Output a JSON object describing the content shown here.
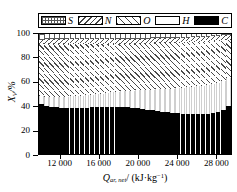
{
  "chart_data": {
    "type": "bar",
    "stacked": true,
    "title": "",
    "xlabel": "Q_ar,net / (kJ·kg⁻¹)",
    "ylabel": "X_V/%",
    "ylim": [
      0,
      100
    ],
    "xlim": [
      9800,
      29600
    ],
    "grid": false,
    "legend_position": "top",
    "legend": [
      {
        "label": "S",
        "pattern": "cross-hatch",
        "color": "#ffffff"
      },
      {
        "label": "N",
        "pattern": "diagonal-back-hatch",
        "color": "#ffffff"
      },
      {
        "label": "O",
        "pattern": "diagonal-forward-hatch",
        "color": "#ffffff"
      },
      {
        "label": "H",
        "pattern": "solid-white",
        "color": "#ffffff"
      },
      {
        "label": "C",
        "pattern": "solid-black",
        "color": "#000000"
      }
    ],
    "ytick_labels": [
      "100",
      "80",
      "60",
      "40",
      "20",
      "0"
    ],
    "ytick_values": [
      100,
      80,
      60,
      40,
      20,
      0
    ],
    "xtick_labels": [
      "12 000",
      "16 000",
      "20 000",
      "24 000",
      "28 000"
    ],
    "xtick_values": [
      12000,
      16000,
      20000,
      24000,
      28000
    ],
    "x": [
      10100,
      10620,
      11140,
      11660,
      12180,
      12700,
      13220,
      13740,
      14260,
      14780,
      15300,
      15820,
      16340,
      16860,
      17380,
      17900,
      18420,
      18940,
      19460,
      19980,
      20500,
      21020,
      21540,
      22060,
      22580,
      23100,
      23620,
      24140,
      24660,
      25180,
      25700,
      26220,
      26740,
      27260,
      27780,
      28300,
      28820,
      29340
    ],
    "series": [
      {
        "name": "C",
        "values": [
          41.3,
          40.2,
          39.2,
          38.8,
          38.6,
          38.5,
          38.5,
          38.5,
          38.6,
          38.7,
          38.8,
          38.9,
          39.0,
          39.1,
          39.1,
          39.1,
          39.0,
          38.8,
          38.5,
          38.1,
          37.6,
          37.0,
          36.4,
          35.7,
          35.1,
          34.6,
          34.1,
          33.8,
          33.5,
          33.3,
          33.2,
          33.2,
          33.3,
          33.6,
          34.2,
          35.2,
          36.8,
          39.6
        ]
      },
      {
        "name": "H",
        "values": [
          7.0,
          7.6,
          8.1,
          8.5,
          8.9,
          9.2,
          9.5,
          9.8,
          10.1,
          10.4,
          10.7,
          11.0,
          11.4,
          11.8,
          12.2,
          12.7,
          13.2,
          13.8,
          14.4,
          15.1,
          15.8,
          16.5,
          17.3,
          18.1,
          18.9,
          19.6,
          20.3,
          21.0,
          21.6,
          22.2,
          22.7,
          23.2,
          23.6,
          23.9,
          24.2,
          24.3,
          24.2,
          23.6
        ]
      },
      {
        "name": "O",
        "values": [
          43.2,
          43.9,
          44.4,
          44.6,
          44.5,
          44.3,
          44.1,
          43.8,
          43.4,
          43.0,
          42.6,
          42.2,
          41.7,
          41.2,
          40.8,
          40.3,
          39.9,
          39.5,
          39.2,
          38.9,
          38.7,
          38.6,
          38.5,
          38.4,
          38.3,
          38.2,
          38.1,
          37.9,
          37.8,
          37.6,
          37.4,
          37.1,
          36.8,
          36.4,
          35.8,
          35.1,
          34.0,
          32.1
        ]
      },
      {
        "name": "N",
        "values": [
          3.8,
          3.9,
          4.0,
          4.0,
          4.1,
          4.1,
          4.1,
          4.1,
          4.1,
          4.1,
          4.1,
          4.1,
          4.1,
          4.1,
          4.1,
          4.1,
          4.1,
          4.1,
          4.1,
          4.1,
          4.1,
          4.1,
          4.1,
          4.1,
          4.0,
          4.0,
          4.0,
          4.0,
          4.0,
          4.0,
          4.0,
          4.0,
          4.0,
          4.0,
          3.9,
          3.9,
          3.8,
          3.6
        ]
      },
      {
        "name": "S",
        "values": [
          4.7,
          4.4,
          4.3,
          4.1,
          3.9,
          3.9,
          3.8,
          3.8,
          3.8,
          3.8,
          3.8,
          3.8,
          3.8,
          3.8,
          3.8,
          3.8,
          3.8,
          3.8,
          3.8,
          3.8,
          3.8,
          3.8,
          3.7,
          3.7,
          3.7,
          3.6,
          3.5,
          3.3,
          3.1,
          2.9,
          2.7,
          2.5,
          2.3,
          2.1,
          1.9,
          1.5,
          1.2,
          1.1
        ]
      }
    ]
  },
  "legend": {
    "items": [
      {
        "label": "S",
        "swatch_class": "sw-S"
      },
      {
        "label": "N",
        "swatch_class": "sw-N"
      },
      {
        "label": "O",
        "swatch_class": "sw-O"
      },
      {
        "label": "H",
        "swatch_class": "sw-H"
      },
      {
        "label": "C",
        "swatch_class": "sw-C"
      }
    ]
  },
  "axes": {
    "y_title_main": "X",
    "y_title_sub": "V",
    "y_title_rest": "/%",
    "x_title_main": "Q",
    "x_title_sub": "ar, net",
    "x_title_rest": "/ (kJ·kg",
    "x_title_sup": "−1",
    "x_title_close": ")"
  }
}
